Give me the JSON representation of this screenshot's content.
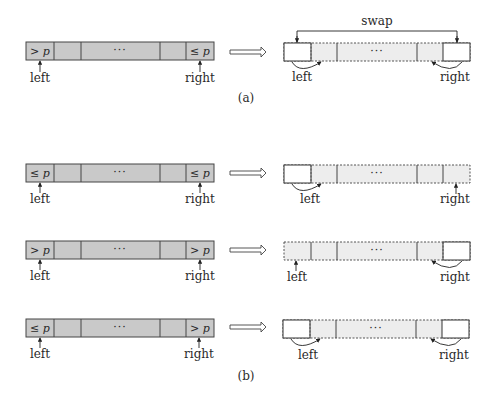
{
  "diagram": {
    "part_a": {
      "caption": "(a)",
      "before": {
        "cells": [
          "> p",
          "",
          "···",
          "",
          "≤ p"
        ],
        "left_label": "left",
        "right_label": "right"
      },
      "after": {
        "swap_label": "swap",
        "cells": [
          "",
          "",
          "···",
          "",
          ""
        ],
        "left_label": "left",
        "right_label": "right"
      }
    },
    "part_b": {
      "caption": "(b)",
      "rows": [
        {
          "before": {
            "cells": [
              "≤ p",
              "",
              "···",
              "",
              "≤ p"
            ],
            "left_label": "left",
            "right_label": "right"
          },
          "after": {
            "cells": [
              "",
              "",
              "···",
              "",
              ""
            ],
            "left_label": "left",
            "right_label": "right"
          }
        },
        {
          "before": {
            "cells": [
              "> p",
              "",
              "···",
              "",
              "> p"
            ],
            "left_label": "left",
            "right_label": "right"
          },
          "after": {
            "cells": [
              "",
              "",
              "···",
              "",
              ""
            ],
            "left_label": "left",
            "right_label": "right"
          }
        },
        {
          "before": {
            "cells": [
              "≤ p",
              "",
              "···",
              "",
              "> p"
            ],
            "left_label": "left",
            "right_label": "right"
          },
          "after": {
            "cells": [
              "",
              "",
              "···",
              "",
              ""
            ],
            "left_label": "left",
            "right_label": "right"
          }
        }
      ]
    },
    "colors": {
      "unprocessed_fill": "#c9c9c9",
      "processed_fill": "#ededed",
      "finalized_fill": "#ffffff",
      "stroke": "#444444"
    }
  }
}
